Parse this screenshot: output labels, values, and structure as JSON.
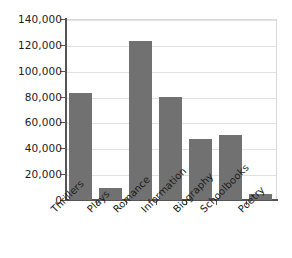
{
  "chart_data": {
    "type": "bar",
    "title": "",
    "xlabel": "",
    "ylabel": "",
    "categories": [
      "Thrillers",
      "Plays",
      "Romance",
      "Information",
      "Biography",
      "Schoolbooks",
      "Poetry"
    ],
    "values": [
      83000,
      9000,
      123000,
      80000,
      47000,
      50000,
      5000
    ],
    "ylim": [
      0,
      140000
    ],
    "ytick_values": [
      0,
      20000,
      40000,
      60000,
      80000,
      100000,
      120000,
      140000
    ],
    "ytick_labels": [
      "0",
      "20,000",
      "40,000",
      "60,000",
      "80,000",
      "100,000",
      "120,000",
      "140,000"
    ],
    "grid": true,
    "legend": false,
    "bar_color": "#717171",
    "axis_color": "#555555",
    "grid_color": "#e2e2e2",
    "text_color": "#1c1c1c"
  }
}
